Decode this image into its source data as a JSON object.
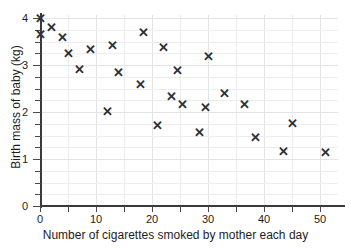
{
  "chart_data": {
    "type": "scatter",
    "title": "",
    "xlabel": "Number of cigarettes smoked by mother each day",
    "ylabel": "Birth mass of baby (kg)",
    "xlim": [
      0,
      54
    ],
    "ylim": [
      0,
      4.25
    ],
    "xticks": [
      0,
      10,
      20,
      30,
      40,
      50
    ],
    "yticks": [
      0,
      1,
      2,
      3,
      4
    ],
    "xtick_labels": [
      "0",
      "10",
      "20",
      "30",
      "40",
      "50"
    ],
    "ytick_labels": [
      "0",
      "1",
      "2",
      "3",
      "4"
    ],
    "x_minor_step": 5,
    "y_minor_step": 0.25,
    "grid": true,
    "legend": null,
    "marker": "x",
    "marker_color": "#2e3033",
    "grid_color": "#eceded",
    "axis_color": "#3a3a3a",
    "points": [
      {
        "x": 0,
        "y": 4.0
      },
      {
        "x": 0,
        "y": 3.65
      },
      {
        "x": 2,
        "y": 3.8
      },
      {
        "x": 4,
        "y": 3.6
      },
      {
        "x": 5,
        "y": 3.25
      },
      {
        "x": 7,
        "y": 2.92
      },
      {
        "x": 9,
        "y": 3.35
      },
      {
        "x": 12,
        "y": 2.02
      },
      {
        "x": 13,
        "y": 3.43
      },
      {
        "x": 14,
        "y": 2.85
      },
      {
        "x": 18,
        "y": 2.6
      },
      {
        "x": 18.5,
        "y": 3.7
      },
      {
        "x": 21,
        "y": 1.73
      },
      {
        "x": 22,
        "y": 3.38
      },
      {
        "x": 23.5,
        "y": 2.33
      },
      {
        "x": 24.5,
        "y": 2.9
      },
      {
        "x": 25.5,
        "y": 2.17
      },
      {
        "x": 28.5,
        "y": 1.58
      },
      {
        "x": 29.5,
        "y": 2.1
      },
      {
        "x": 30,
        "y": 3.2
      },
      {
        "x": 33,
        "y": 2.4
      },
      {
        "x": 36.5,
        "y": 2.18
      },
      {
        "x": 38.5,
        "y": 1.47
      },
      {
        "x": 43.5,
        "y": 1.17
      },
      {
        "x": 45,
        "y": 1.76
      },
      {
        "x": 51,
        "y": 1.14
      }
    ]
  }
}
